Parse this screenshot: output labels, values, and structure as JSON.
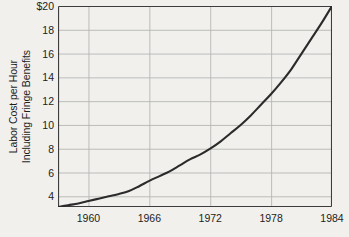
{
  "chart_data": {
    "type": "line",
    "title": "",
    "xlabel": "",
    "ylabel": "Labor Cost per Hour Including Fringe Benefits",
    "ylabel_lines": [
      "Labor Cost per Hour",
      "Including Fringe Benefits"
    ],
    "xlim": [
      1957,
      1984
    ],
    "ylim": [
      3.1,
      20
    ],
    "grid": true,
    "legend": "none",
    "y_axis_prefix": "$",
    "x_ticks": [
      1960,
      1966,
      1972,
      1978,
      1984
    ],
    "x_tick_labels": [
      "1960",
      "1966",
      "1972",
      "1978",
      "1984"
    ],
    "y_ticks": [
      20,
      18,
      16,
      14,
      12,
      10,
      8,
      6,
      4
    ],
    "y_tick_labels": [
      "$20",
      "18",
      "16",
      "14",
      "12",
      "10",
      "8",
      "6",
      "4"
    ],
    "series": [
      {
        "name": "Labor Cost per Hour Including Fringe Benefits",
        "color": "#2b2b2b",
        "x": [
          1957,
          1958,
          1959,
          1960,
          1961,
          1962,
          1963,
          1964,
          1965,
          1966,
          1967,
          1968,
          1969,
          1970,
          1971,
          1972,
          1973,
          1974,
          1975,
          1976,
          1977,
          1978,
          1979,
          1980,
          1981,
          1982,
          1983,
          1984
        ],
        "values": [
          3.1,
          3.25,
          3.4,
          3.6,
          3.8,
          4.0,
          4.2,
          4.45,
          4.85,
          5.3,
          5.7,
          6.1,
          6.6,
          7.1,
          7.5,
          8.0,
          8.6,
          9.3,
          10.0,
          10.8,
          11.7,
          12.6,
          13.6,
          14.7,
          16.0,
          17.3,
          18.6,
          20.0
        ]
      }
    ],
    "colors": {
      "background": "#f1f0ed",
      "grid": "#b5b5b5",
      "axis": "#3d3d3d",
      "line": "#2b2b2b",
      "text": "#1d1d1b"
    }
  }
}
